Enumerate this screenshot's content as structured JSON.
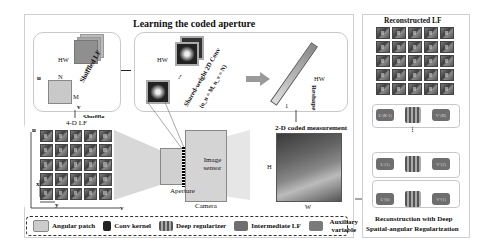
{
  "learning": {
    "title": "Learning the coded aperture",
    "shuffled_box": {
      "hw": "HW",
      "u": "u",
      "v": "v",
      "n": "N",
      "m": "M",
      "stack_label": "Shuffled LF",
      "dots": "..."
    },
    "conv_box": {
      "hw": "HW",
      "dots": "...",
      "label": "Shared-weight 2D Conv",
      "params": "(n_u = M, n_v = N)"
    },
    "vector": {
      "hw": "HW",
      "one": "1",
      "reshape": "Reshape"
    },
    "shuffle": "Shuffle"
  },
  "capture": {
    "lf_label": "4-D LF",
    "axes": {
      "u": "u",
      "v": "v",
      "x": "x",
      "y": "y"
    },
    "aperture": "Aperture",
    "sensor": "Image sensor",
    "camera": "Camera",
    "measurement_label": "2-D coded measurement",
    "h": "H",
    "w": "W"
  },
  "lf_grid": {
    "rows": 5,
    "cols": 5
  },
  "reconstruction": {
    "title": "Reconstructed LF",
    "footer_line1": "Reconstruction with Deep",
    "footer_line2": "Spatial-angular Regularization",
    "stages": [
      {
        "input": "L^(K-1)",
        "output": "V^(K)"
      },
      {
        "input": "L^(1)",
        "output": "V^(2)"
      },
      {
        "input": "L^(0)",
        "output": "V^(1)"
      }
    ],
    "dots": "..."
  },
  "legend": {
    "items": [
      {
        "icon": "angular-patch-icon",
        "label": "Angular patch"
      },
      {
        "icon": "conv-kernel-icon",
        "label": "Conv kernel"
      },
      {
        "icon": "deep-regularizer-icon",
        "label": "Deep regularizer"
      },
      {
        "icon": "intermediate-lf-icon",
        "label": "Intermediate LF"
      },
      {
        "icon": "auxiliary-variable-icon",
        "label": "Auxiliary variable"
      }
    ]
  },
  "colors": {
    "panel_border": "#cfcfcf",
    "node_fill": "#6e6e6e",
    "tile_dark": "#3d3d3d",
    "accent_gray": "#9a9a9a"
  }
}
